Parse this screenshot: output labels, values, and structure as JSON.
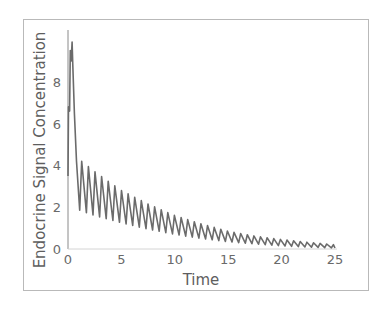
{
  "chart_data": {
    "type": "line",
    "title": "",
    "xlabel": "Time",
    "ylabel": "Endocrine Signal Concentration",
    "xlim": [
      0,
      25
    ],
    "ylim": [
      0,
      10
    ],
    "x_ticks": [
      0,
      5,
      10,
      15,
      20,
      25
    ],
    "y_ticks": [
      0,
      2,
      4,
      6,
      8
    ],
    "grid": false,
    "legend": null,
    "line_color": "#6b6b6b",
    "oscillation_period": 0.62,
    "initial_phase": [
      {
        "x": 0.0,
        "y": 3.5
      },
      {
        "x": 0.05,
        "y": 6.8
      },
      {
        "x": 0.15,
        "y": 6.6
      },
      {
        "x": 0.22,
        "y": 9.5
      },
      {
        "x": 0.3,
        "y": 9.0
      },
      {
        "x": 0.38,
        "y": 9.9
      },
      {
        "x": 0.45,
        "y": 8.8
      },
      {
        "x": 0.6,
        "y": 6.5
      },
      {
        "x": 0.8,
        "y": 4.2
      },
      {
        "x": 1.1,
        "y": 1.85
      }
    ],
    "envelope": {
      "peaks": [
        {
          "x": 1.3,
          "y": 4.2
        },
        {
          "x": 2.5,
          "y": 3.7
        },
        {
          "x": 5.0,
          "y": 2.8
        },
        {
          "x": 7.5,
          "y": 2.15
        },
        {
          "x": 10.0,
          "y": 1.6
        },
        {
          "x": 12.5,
          "y": 1.2
        },
        {
          "x": 15.0,
          "y": 0.85
        },
        {
          "x": 17.5,
          "y": 0.62
        },
        {
          "x": 20.0,
          "y": 0.45
        },
        {
          "x": 22.5,
          "y": 0.32
        },
        {
          "x": 25.0,
          "y": 0.2
        }
      ],
      "troughs": [
        {
          "x": 1.1,
          "y": 1.85
        },
        {
          "x": 2.5,
          "y": 1.6
        },
        {
          "x": 5.0,
          "y": 1.25
        },
        {
          "x": 7.5,
          "y": 0.95
        },
        {
          "x": 10.0,
          "y": 0.7
        },
        {
          "x": 12.5,
          "y": 0.5
        },
        {
          "x": 15.0,
          "y": 0.35
        },
        {
          "x": 17.5,
          "y": 0.24
        },
        {
          "x": 20.0,
          "y": 0.15
        },
        {
          "x": 22.5,
          "y": 0.09
        },
        {
          "x": 25.0,
          "y": 0.05
        }
      ]
    }
  }
}
